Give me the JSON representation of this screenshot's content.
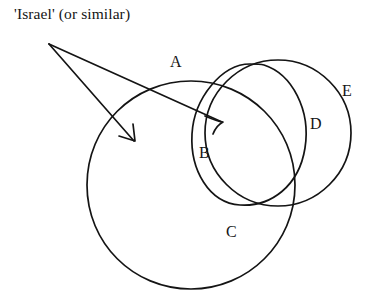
{
  "diagram": {
    "title_caption": "'Israel' (or similar)",
    "background_color": "#ffffff",
    "stroke_color": "#141414",
    "labels": {
      "a": "A",
      "b": "B",
      "c": "C",
      "d": "D",
      "e": "E"
    },
    "shapes": [
      {
        "id": "circle-c",
        "label": "C",
        "type": "circle",
        "cx": 191,
        "cy": 185,
        "r": 104
      },
      {
        "id": "circle-b",
        "label": "B",
        "type": "ellipse",
        "cx": 250,
        "cy": 135,
        "rx": 62,
        "ry": 72,
        "rotation": -18
      },
      {
        "id": "circle-e",
        "label": "E",
        "type": "circle",
        "cx": 278,
        "cy": 133,
        "r": 73
      }
    ],
    "arrows": [
      {
        "id": "arrow-left",
        "from_x": 49,
        "from_y": 44,
        "to_x": 134,
        "to_y": 141,
        "target_label": "A"
      },
      {
        "id": "arrow-right",
        "from_x": 49,
        "from_y": 44,
        "to_x": 223,
        "to_y": 122,
        "target_label": "B"
      }
    ]
  }
}
